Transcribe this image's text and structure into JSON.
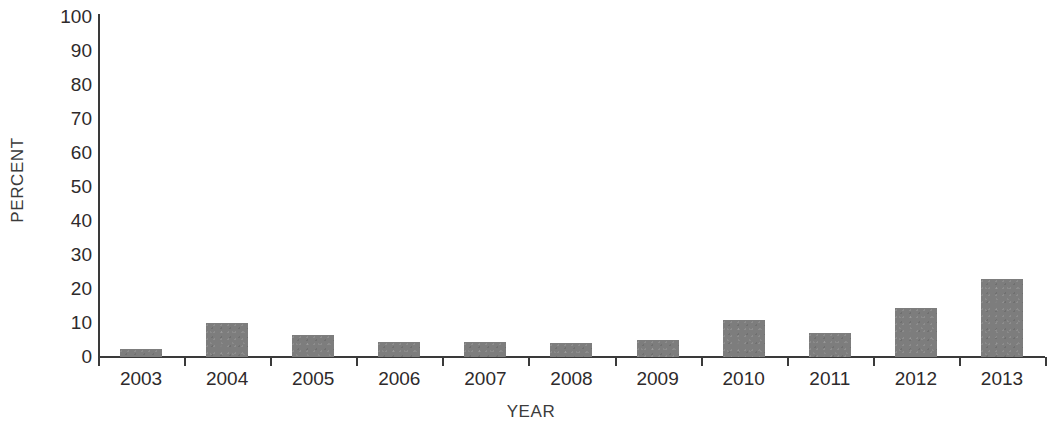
{
  "chart_data": {
    "type": "bar",
    "title": "",
    "xlabel": "YEAR",
    "ylabel": "PERCENT",
    "categories": [
      "2003",
      "2004",
      "2005",
      "2006",
      "2007",
      "2008",
      "2009",
      "2010",
      "2011",
      "2012",
      "2013"
    ],
    "values": [
      2.5,
      10,
      6.5,
      4.5,
      4.5,
      4,
      5,
      11,
      7,
      14.5,
      23
    ],
    "series": [
      {
        "name": "Percent",
        "values": [
          2.5,
          10,
          6.5,
          4.5,
          4.5,
          4,
          5,
          11,
          7,
          14.5,
          23
        ]
      }
    ],
    "ylim": [
      0,
      100
    ],
    "ytick_labels": [
      "100",
      "90",
      "80",
      "70",
      "60",
      "50",
      "40",
      "30",
      "20",
      "10",
      "0"
    ],
    "ytick_values": [
      100,
      90,
      80,
      70,
      60,
      50,
      40,
      30,
      20,
      10,
      0
    ],
    "grid": false,
    "legend": "none",
    "bar_color": "#7d7d7d",
    "axis_color": "#3a3a3a",
    "text_color": "#2e2a2b",
    "background": "#ffffff"
  }
}
